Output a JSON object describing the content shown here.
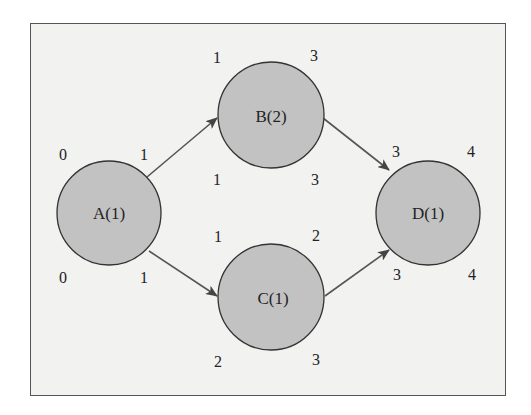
{
  "diagram": {
    "type": "activity-on-node network",
    "nodes": [
      {
        "id": "A",
        "label": "A(1)",
        "cx": 109,
        "cy": 213,
        "es": "0",
        "ef": "1",
        "ls": "0",
        "lf": "1"
      },
      {
        "id": "B",
        "label": "B(2)",
        "cx": 271,
        "cy": 115,
        "es": "1",
        "ef": "3",
        "ls": "1",
        "lf": "3"
      },
      {
        "id": "C",
        "label": "C(1)",
        "cx": 271,
        "cy": 297,
        "es": "1",
        "ef": "2",
        "ls": "2",
        "lf": "3"
      },
      {
        "id": "D",
        "label": "D(1)",
        "cx": 428,
        "cy": 213,
        "es": "3",
        "ef": "4",
        "ls": "3",
        "lf": "4"
      }
    ],
    "edges": [
      {
        "from": "A",
        "to": "B"
      },
      {
        "from": "A",
        "to": "C"
      },
      {
        "from": "B",
        "to": "D"
      },
      {
        "from": "C",
        "to": "D"
      }
    ],
    "colors": {
      "node_fill": "#c2c2c2",
      "node_stroke": "#333333",
      "background": "#f2f2f1",
      "edge": "#555555"
    }
  }
}
